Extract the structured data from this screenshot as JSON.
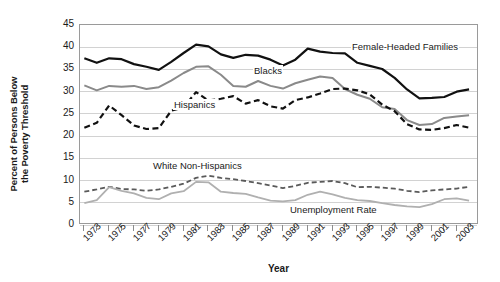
{
  "chart_data": {
    "type": "line",
    "title": "",
    "xlabel": "Year",
    "ylabel_line1": "Percent of Persons Below",
    "ylabel_line2": "the Poverty Threshold",
    "ylim": [
      0,
      45
    ],
    "yticks": [
      0,
      5,
      10,
      15,
      20,
      25,
      30,
      35,
      40,
      45
    ],
    "grid": true,
    "legend_position": "inline-annotations",
    "x": [
      1973,
      1974,
      1975,
      1976,
      1977,
      1978,
      1979,
      1980,
      1981,
      1982,
      1983,
      1984,
      1985,
      1986,
      1987,
      1988,
      1989,
      1990,
      1991,
      1992,
      1993,
      1994,
      1995,
      1996,
      1997,
      1998,
      1999,
      2000,
      2001,
      2002,
      2003,
      2004
    ],
    "xtick_labels": [
      "1973",
      "1975",
      "1977",
      "1979",
      "1981",
      "1983",
      "1985",
      "1987",
      "1989",
      "1991",
      "1993",
      "1995",
      "1997",
      "1999",
      "2001",
      "2003"
    ],
    "series": [
      {
        "name": "Female-Headed Families",
        "color": "#111111",
        "style": "solid",
        "width": 2.2,
        "values": [
          37.5,
          36.5,
          37.5,
          37.3,
          36.2,
          35.6,
          34.9,
          36.7,
          38.7,
          40.6,
          40.2,
          38.4,
          37.6,
          38.3,
          38.1,
          37.2,
          35.9,
          37.2,
          39.7,
          39.0,
          38.7,
          38.6,
          36.5,
          35.8,
          35.1,
          33.1,
          30.5,
          28.5,
          28.6,
          28.8,
          30.0,
          30.5
        ]
      },
      {
        "name": "Blacks",
        "color": "#8a8a8a",
        "style": "solid",
        "width": 2.0,
        "values": [
          31.4,
          30.3,
          31.3,
          31.1,
          31.3,
          30.6,
          31.0,
          32.5,
          34.2,
          35.6,
          35.7,
          33.8,
          31.3,
          31.1,
          32.4,
          31.3,
          30.7,
          31.9,
          32.7,
          33.4,
          33.1,
          30.6,
          29.3,
          28.4,
          26.5,
          26.1,
          23.6,
          22.5,
          22.7,
          24.1,
          24.4,
          24.7
        ]
      },
      {
        "name": "Hispanics",
        "color": "#111111",
        "style": "dashed",
        "width": 2.2,
        "values": [
          21.9,
          23.0,
          26.9,
          24.7,
          22.4,
          21.6,
          21.8,
          25.7,
          26.5,
          29.9,
          28.0,
          28.4,
          29.0,
          27.3,
          28.1,
          26.7,
          26.2,
          28.1,
          28.7,
          29.6,
          30.6,
          30.7,
          30.3,
          29.4,
          27.1,
          25.6,
          22.7,
          21.5,
          21.4,
          21.8,
          22.5,
          21.9
        ]
      },
      {
        "name": "White Non-Hispanics",
        "color": "#5a5a5a",
        "style": "dashed",
        "width": 1.8,
        "values": [
          7.5,
          8.0,
          8.6,
          8.1,
          8.0,
          7.7,
          8.0,
          8.6,
          9.3,
          10.6,
          11.1,
          10.6,
          10.3,
          9.9,
          9.4,
          8.9,
          8.3,
          8.8,
          9.5,
          9.7,
          9.9,
          9.4,
          8.5,
          8.6,
          8.4,
          8.2,
          7.7,
          7.4,
          7.8,
          8.0,
          8.2,
          8.6
        ]
      },
      {
        "name": "Unemployment Rate",
        "color": "#b0b0b0",
        "style": "solid",
        "width": 1.8,
        "values": [
          4.9,
          5.6,
          8.5,
          7.7,
          7.1,
          6.1,
          5.8,
          7.1,
          7.6,
          9.7,
          9.6,
          7.5,
          7.2,
          7.0,
          6.2,
          5.5,
          5.3,
          5.6,
          6.8,
          7.5,
          6.9,
          6.1,
          5.6,
          5.4,
          4.9,
          4.5,
          4.2,
          4.0,
          4.7,
          5.8,
          6.0,
          5.5
        ]
      }
    ],
    "annotations": [
      {
        "label": "Female-Headed Families",
        "x": 351,
        "y": 41
      },
      {
        "label": "Blacks",
        "x": 253,
        "y": 65
      },
      {
        "label": "Hispanics",
        "x": 173,
        "y": 99
      },
      {
        "label": "White Non-Hispanics",
        "x": 152,
        "y": 160
      },
      {
        "label": "Unemployment Rate",
        "x": 289,
        "y": 204
      }
    ]
  }
}
